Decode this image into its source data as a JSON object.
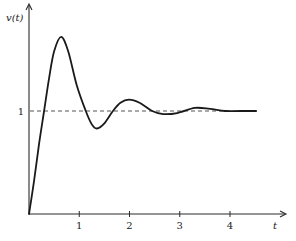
{
  "chart_data": {
    "type": "line",
    "title": "",
    "xlabel": "t",
    "ylabel": "v(t)",
    "xlim": [
      0,
      5.1
    ],
    "ylim": [
      0,
      2.0
    ],
    "xticks": [
      1,
      2,
      3,
      4
    ],
    "xtick_labels": [
      "1",
      "2",
      "3",
      "4"
    ],
    "yticks": [
      1
    ],
    "ytick_labels": [
      "1"
    ],
    "grid": false,
    "reference_lines": [
      {
        "name": "steady-state",
        "y": 1,
        "x_range": [
          0,
          4.52
        ],
        "style": "dashed"
      }
    ],
    "series": [
      {
        "name": "v(t)",
        "x": [
          0,
          0.1,
          0.2,
          0.3,
          0.4,
          0.5,
          0.64,
          0.78,
          0.95,
          1.13,
          1.25,
          1.35,
          1.5,
          1.67,
          1.82,
          1.99,
          2.2,
          2.45,
          2.67,
          2.95,
          3.3,
          3.6,
          3.9,
          4.2,
          4.52
        ],
        "y": [
          0,
          0.32,
          0.68,
          1.0,
          1.32,
          1.58,
          1.72,
          1.58,
          1.25,
          1.0,
          0.87,
          0.83,
          0.88,
          1.0,
          1.08,
          1.11,
          1.08,
          1.0,
          0.97,
          0.98,
          1.03,
          1.02,
          1.0,
          1.0,
          1.0
        ]
      }
    ]
  }
}
